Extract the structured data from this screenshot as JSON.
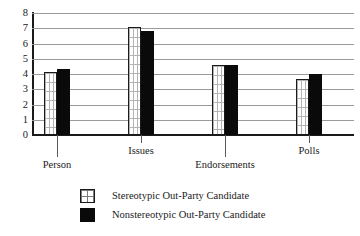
{
  "chart_data": {
    "type": "bar",
    "title": "",
    "xlabel": "",
    "ylabel": "",
    "ylim": [
      0,
      8
    ],
    "yticks": [
      "0",
      "1",
      "2",
      "3",
      "4",
      "5",
      "6",
      "7",
      "8"
    ],
    "grid": true,
    "legend_position": "bottom-left",
    "categories": [
      "Person",
      "Issues",
      "Endorsements",
      "Polls"
    ],
    "series": [
      {
        "name": "Stereotypic Out-Party Candidate",
        "style": "white-grid-pattern",
        "color": "#ffffff",
        "values": [
          4.1,
          7.1,
          4.6,
          3.7
        ]
      },
      {
        "name": "Nonstereotypic Out-Party Candidate",
        "style": "solid-black",
        "color": "#0a0a0a",
        "values": [
          4.3,
          6.85,
          4.6,
          4.0
        ]
      }
    ]
  },
  "axis": {
    "y_tick_labels": [
      "8",
      "7",
      "6",
      "5",
      "4",
      "3",
      "2",
      "1",
      "0"
    ]
  },
  "legend": {
    "items": [
      {
        "label": "Stereotypic Out-Party Candidate"
      },
      {
        "label": "Nonstereotypic Out-Party Candidate"
      }
    ]
  }
}
